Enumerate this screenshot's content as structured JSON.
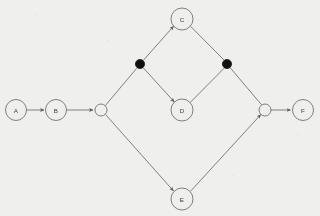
{
  "diagram": {
    "type": "directed-graph",
    "title": "",
    "canvas": {
      "width": 320,
      "height": 216
    },
    "colors": {
      "background": "#efefee",
      "stroke": "#6b6b6b",
      "node_fill": "#efefee",
      "filled_node": "#111111",
      "label_text": "#3a3a3a"
    },
    "nodes": [
      {
        "id": "A",
        "label": "A",
        "x": 16,
        "y": 110,
        "r": 10.5,
        "style": "open-circle",
        "labeled": true
      },
      {
        "id": "B",
        "label": "B",
        "x": 56,
        "y": 110,
        "r": 10.5,
        "style": "open-circle",
        "labeled": true
      },
      {
        "id": "J1",
        "label": "",
        "x": 101,
        "y": 110,
        "r": 6.0,
        "style": "open-circle",
        "labeled": false
      },
      {
        "id": "P1",
        "label": "",
        "x": 140,
        "y": 64,
        "r": 4.6,
        "style": "filled-circle",
        "labeled": false
      },
      {
        "id": "C",
        "label": "C",
        "x": 182,
        "y": 19,
        "r": 11.0,
        "style": "open-circle",
        "labeled": true
      },
      {
        "id": "D",
        "label": "D",
        "x": 182,
        "y": 110,
        "r": 11.0,
        "style": "open-circle",
        "labeled": true
      },
      {
        "id": "P2",
        "label": "",
        "x": 227,
        "y": 64,
        "r": 4.6,
        "style": "filled-circle",
        "labeled": false
      },
      {
        "id": "J2",
        "label": "",
        "x": 265,
        "y": 110,
        "r": 6.0,
        "style": "open-circle",
        "labeled": false
      },
      {
        "id": "E",
        "label": "E",
        "x": 182,
        "y": 199,
        "r": 11.0,
        "style": "open-circle",
        "labeled": true
      },
      {
        "id": "F",
        "label": "F",
        "x": 303,
        "y": 110,
        "r": 10.5,
        "style": "open-circle",
        "labeled": true
      }
    ],
    "edges": [
      {
        "from": "A",
        "to": "B",
        "arrow": true
      },
      {
        "from": "B",
        "to": "J1",
        "arrow": true
      },
      {
        "from": "J1",
        "to": "P1",
        "arrow": false
      },
      {
        "from": "J1",
        "to": "E",
        "arrow": true
      },
      {
        "from": "P1",
        "to": "C",
        "arrow": true
      },
      {
        "from": "P1",
        "to": "D",
        "arrow": true
      },
      {
        "from": "C",
        "to": "P2",
        "arrow": false
      },
      {
        "from": "D",
        "to": "P2",
        "arrow": false
      },
      {
        "from": "P2",
        "to": "J2",
        "arrow": false
      },
      {
        "from": "E",
        "to": "J2",
        "arrow": true
      },
      {
        "from": "J2",
        "to": "F",
        "arrow": true
      }
    ]
  }
}
